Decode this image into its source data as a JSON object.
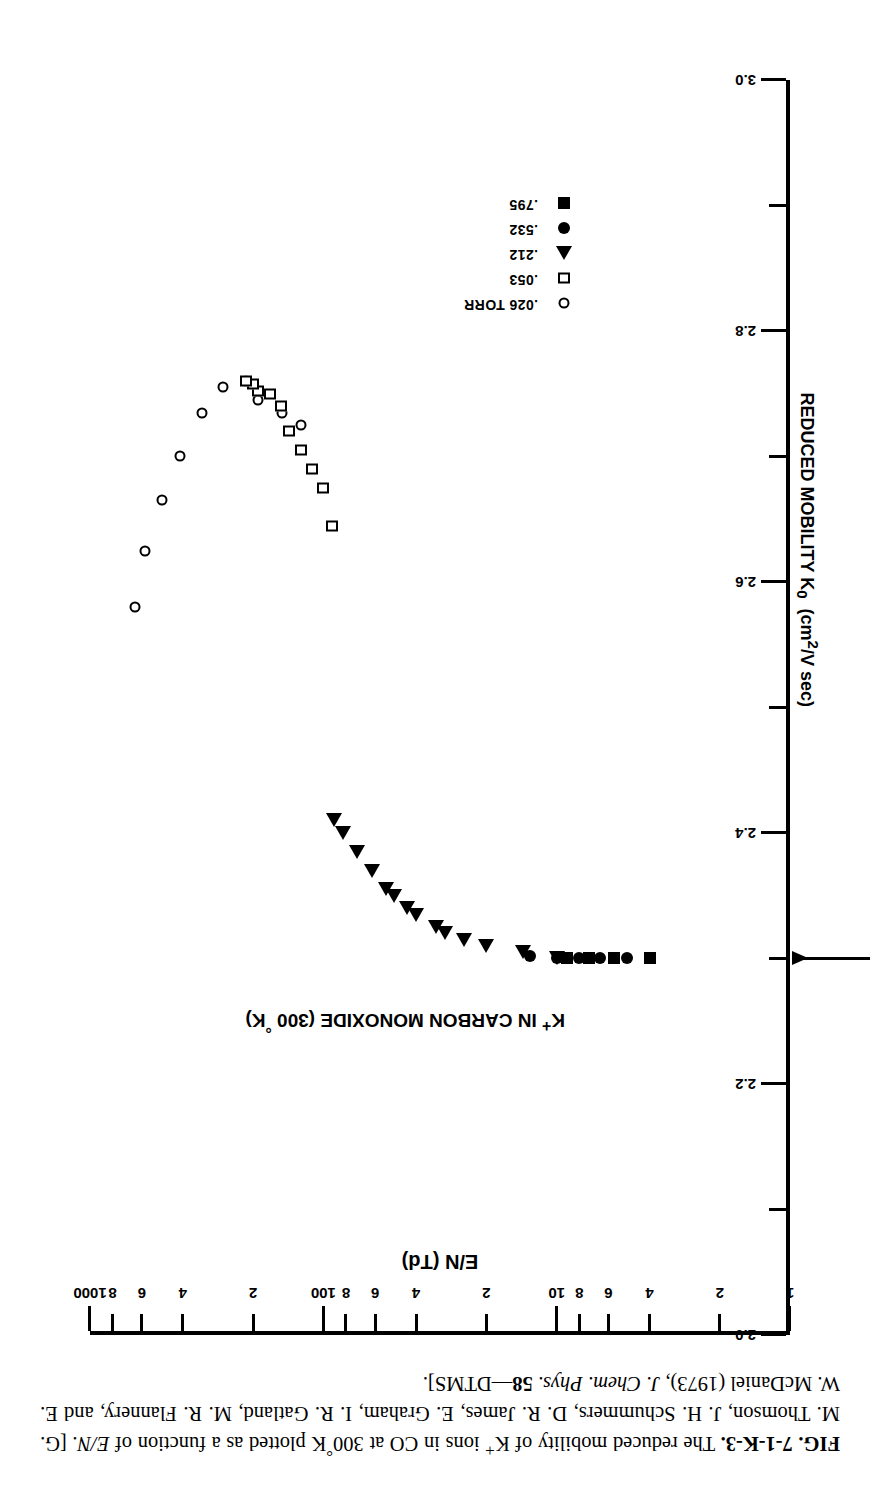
{
  "figure": {
    "label": "FIG. 7-1-K-3.",
    "caption_parts": {
      "p1": "The reduced mobility of K",
      "sup_plus": "+",
      "p2": " ions in CO at 300",
      "deg": "°",
      "p3": "K plotted as a function of ",
      "ital_en": "E/N",
      "p4": ". [G. M. Thomson, J. H. Schummers, D. R. James, E. Graham, I. R. Gatland, M. R. Flannery, and E. W. McDaniel (1973), ",
      "journal": "J. Chem. Phys.",
      "volume": "58",
      "p5": "—DTMS]."
    }
  },
  "plot": {
    "title_main": "K",
    "title_sup": "+",
    "title_rest": " IN CARBON MONOXIDE (300 ",
    "title_deg": "°",
    "title_end": "K)"
  },
  "reference_line": {
    "label": "2.30",
    "value": 2.3
  },
  "legend": {
    "items": [
      {
        "symbol": "open-circle",
        "label": ".026 TORR"
      },
      {
        "symbol": "open-square",
        "label": ".053"
      },
      {
        "symbol": "filled-triangle",
        "label": ".212"
      },
      {
        "symbol": "filled-circle",
        "label": ".532"
      },
      {
        "symbol": "filled-square",
        "label": ".795"
      }
    ]
  },
  "chart_data": {
    "type": "scatter",
    "title": "K+ IN CARBON MONOXIDE (300 °K)",
    "xlabel": "E/N (Td)",
    "ylabel": "REDUCED MOBILITY K0 (cm2/V sec)",
    "xscale": "log",
    "yscale": "linear",
    "xlim": [
      1,
      1000
    ],
    "ylim": [
      2.0,
      3.0
    ],
    "grid": false,
    "legend_position": "lower-left-inside",
    "xticks_major": [
      1,
      10,
      100,
      1000
    ],
    "xticks_major_labels": [
      "1",
      "10",
      "100",
      "1000"
    ],
    "xticks_minor": [
      2,
      4,
      6,
      8,
      20,
      40,
      60,
      80,
      200,
      400,
      600,
      800
    ],
    "xticks_minor_labels": [
      "2",
      "4",
      "6",
      "8",
      "2",
      "4",
      "6",
      "8",
      "2",
      "4",
      "6",
      "8"
    ],
    "yticks": [
      2.0,
      2.1,
      2.2,
      2.3,
      2.4,
      2.5,
      2.6,
      2.7,
      2.8,
      2.9,
      3.0
    ],
    "yticks_labels": [
      "2.0",
      "",
      "2.2",
      "",
      "2.4",
      "",
      "2.6",
      "",
      "2.8",
      "",
      "3.0"
    ],
    "annotations": [
      {
        "text": "2.30",
        "y": 2.3,
        "type": "arrow-to-axis"
      }
    ],
    "series": [
      {
        "name": ".026 TORR",
        "symbol": "open-circle",
        "points": [
          [
            125,
            2.725
          ],
          [
            150,
            2.735
          ],
          [
            190,
            2.745
          ],
          [
            215,
            2.76
          ],
          [
            270,
            2.755
          ],
          [
            330,
            2.735
          ],
          [
            410,
            2.7
          ],
          [
            490,
            2.665
          ],
          [
            580,
            2.625
          ],
          [
            640,
            2.58
          ]
        ]
      },
      {
        "name": ".053",
        "symbol": "open-square",
        "points": [
          [
            92,
            2.645
          ],
          [
            100,
            2.675
          ],
          [
            112,
            2.69
          ],
          [
            125,
            2.705
          ],
          [
            140,
            2.72
          ],
          [
            152,
            2.74
          ],
          [
            170,
            2.75
          ],
          [
            190,
            2.752
          ],
          [
            200,
            2.758
          ],
          [
            215,
            2.76
          ]
        ]
      },
      {
        "name": ".212",
        "symbol": "filled-triangle",
        "points": [
          [
            10,
            2.3
          ],
          [
            14,
            2.305
          ],
          [
            20,
            2.31
          ],
          [
            25,
            2.315
          ],
          [
            30,
            2.32
          ],
          [
            33,
            2.325
          ],
          [
            40,
            2.335
          ],
          [
            44,
            2.34
          ],
          [
            50,
            2.35
          ],
          [
            54,
            2.355
          ],
          [
            62,
            2.37
          ],
          [
            72,
            2.385
          ],
          [
            82,
            2.4
          ],
          [
            90,
            2.41
          ]
        ]
      },
      {
        "name": ".532",
        "symbol": "filled-circle",
        "points": [
          [
            5,
            2.3
          ],
          [
            6.5,
            2.3
          ],
          [
            8,
            2.3
          ],
          [
            10,
            2.3
          ],
          [
            13,
            2.302
          ]
        ]
      },
      {
        "name": ".795",
        "symbol": "filled-square",
        "points": [
          [
            4,
            2.3
          ],
          [
            5.7,
            2.3
          ],
          [
            7.3,
            2.3
          ],
          [
            9,
            2.3
          ]
        ]
      }
    ]
  }
}
